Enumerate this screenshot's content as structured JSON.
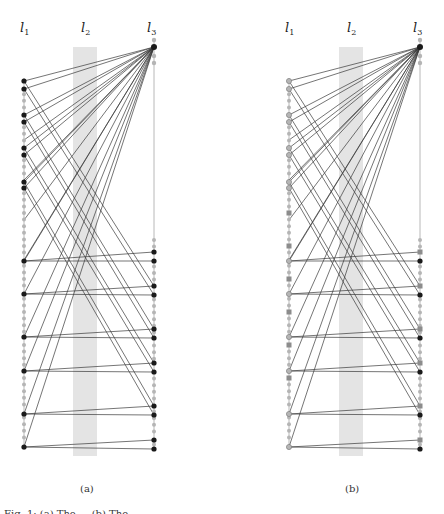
{
  "figure": {
    "panels": [
      {
        "id": "a",
        "label": "(a)",
        "layers": [
          {
            "label": "l",
            "sub": "1"
          },
          {
            "label": "l",
            "sub": "2"
          },
          {
            "label": "l",
            "sub": "3"
          }
        ],
        "node_style": "black-and-gray-circles"
      },
      {
        "id": "b",
        "label": "(b)",
        "layers": [
          {
            "label": "l",
            "sub": "1"
          },
          {
            "label": "l",
            "sub": "2"
          },
          {
            "label": "l",
            "sub": "3"
          }
        ],
        "node_style": "gray-circles-and-squares"
      }
    ],
    "caption": "Fig. 1: (a) The ... (b) The ..."
  },
  "colors": {
    "edge": "#3a3a3a",
    "column_line": "#b8b8b8",
    "band": "#e4e4e4",
    "node_dark": "#1a1a1a",
    "node_gray": "#b5b5b5",
    "node_mid": "#8c8c8c"
  }
}
